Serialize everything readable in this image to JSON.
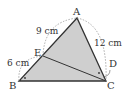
{
  "figure": {
    "type": "triangle-geometry",
    "points": {
      "A": {
        "label": "A",
        "x": 77,
        "y": 18
      },
      "B": {
        "label": "B",
        "x": 19,
        "y": 81
      },
      "C": {
        "label": "C",
        "x": 106,
        "y": 81
      },
      "D": {
        "label": "D",
        "x": 103,
        "y": 77
      },
      "E": {
        "label": "E",
        "x": 43,
        "y": 56
      }
    },
    "segments": [
      "AB",
      "BC",
      "CA",
      "EC"
    ],
    "measurements": {
      "AE": "9 cm",
      "EB": "6 cm",
      "AC": "12 cm"
    },
    "right_angle_marks": [
      "B",
      "D"
    ],
    "colors": {
      "fill": "#cfcfcf",
      "stroke": "#333333",
      "dash": "#888888"
    }
  }
}
